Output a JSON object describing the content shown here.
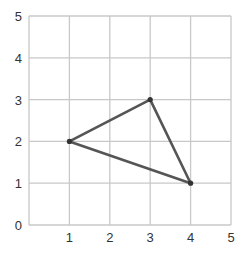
{
  "chart_data": {
    "type": "scatter",
    "title": "",
    "xlabel": "",
    "ylabel": "",
    "xlim": [
      0,
      5
    ],
    "ylim": [
      0,
      5
    ],
    "grid": true,
    "x_ticks": [
      "1",
      "2",
      "3",
      "4",
      "5"
    ],
    "y_ticks": [
      "0",
      "1",
      "2",
      "3",
      "4",
      "5"
    ],
    "series": [
      {
        "name": "triangle",
        "shape": "closed-polygon",
        "points": [
          {
            "x": 1,
            "y": 2
          },
          {
            "x": 3,
            "y": 3
          },
          {
            "x": 4,
            "y": 1
          }
        ]
      }
    ],
    "colors": {
      "grid": "#c8c8c8",
      "line": "#555555",
      "vertex": "#333333",
      "text": "#333333"
    }
  }
}
